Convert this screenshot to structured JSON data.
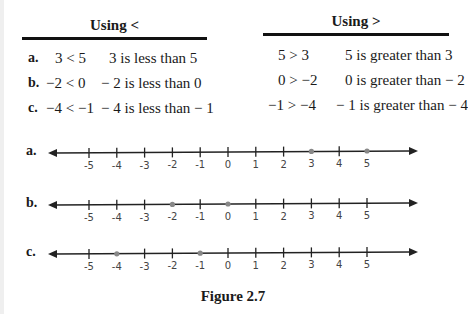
{
  "tables": {
    "left": {
      "heading": "Using <",
      "rows": [
        {
          "label": "a.",
          "expression": "3 < 5",
          "sentence": "3 is less than 5"
        },
        {
          "label": "b.",
          "expression": "−2 < 0",
          "sentence": "− 2 is less than 0"
        },
        {
          "label": "c.",
          "expression": "−4 < −1",
          "sentence": "− 4 is less than − 1"
        }
      ]
    },
    "right": {
      "heading": "Using >",
      "rows": [
        {
          "expression": "5 > 3",
          "sentence": "5 is greater than 3"
        },
        {
          "expression": "0 > −2",
          "sentence": "0 is greater than − 2"
        },
        {
          "expression": "−1 > −4",
          "sentence": "− 1 is greater than − 4"
        }
      ]
    }
  },
  "number_lines": [
    {
      "label": "a.",
      "highlighted": [
        3,
        5
      ]
    },
    {
      "label": "b.",
      "highlighted": [
        -2,
        0
      ]
    },
    {
      "label": "c.",
      "highlighted": [
        -4,
        -1
      ]
    }
  ],
  "tick_labels": [
    "-5",
    "-4",
    "-3",
    "-2",
    "-1",
    "0",
    "1",
    "2",
    "3",
    "4",
    "5"
  ],
  "caption": "Figure 2.7"
}
